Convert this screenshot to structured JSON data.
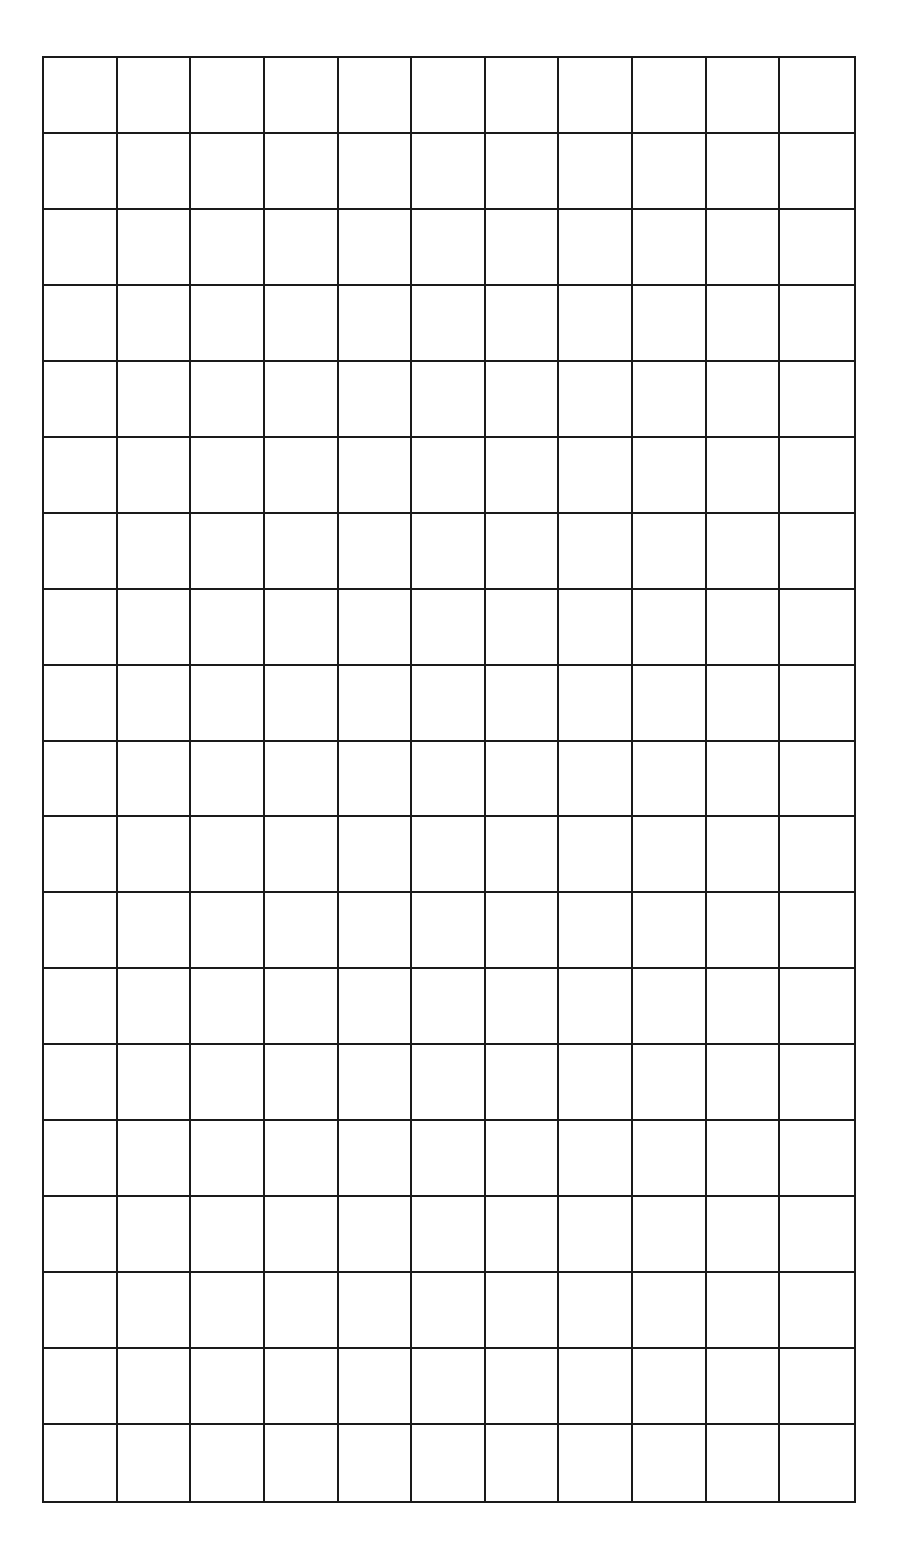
{
  "grid": {
    "columns": 11,
    "rows": 19,
    "line_color": "#1a1a1a",
    "background_color": "#ffffff",
    "cells": []
  }
}
